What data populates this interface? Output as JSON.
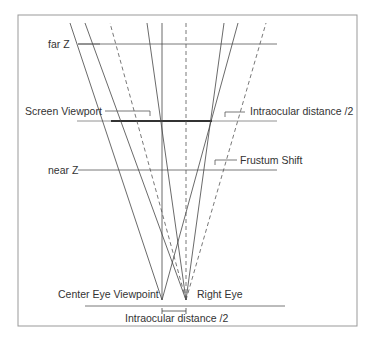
{
  "labels": {
    "far_z": "far Z",
    "screen_viewport": "Screen Viewport",
    "intraocular_top": "Intraocular distance /2",
    "frustum_shift": "Frustum Shift",
    "near_z": "near Z",
    "center_eye": "Center Eye Viewpoint",
    "right_eye": "Right Eye",
    "intraocular_bottom": "Intraocular distance /2"
  },
  "colors": {
    "line": "#555555",
    "frame": "#888888",
    "text": "#333333"
  }
}
